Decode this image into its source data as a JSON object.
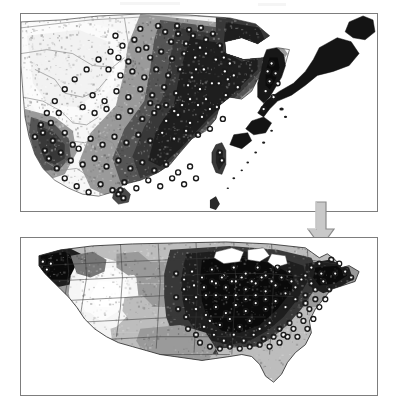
{
  "figure": {
    "title": "",
    "caption": "",
    "background_color": "#ffffff",
    "width": 396,
    "height": 410
  },
  "arrow": {
    "name": "down-arrow",
    "direction": "down",
    "fill_color": "#c9c9c9",
    "stroke_color": "#8a8a8a",
    "label": ""
  },
  "panels": [
    {
      "id": "panel-east-asia",
      "name": "east-asia-map-panel",
      "label": "",
      "region": "East Asia (China, Korea, Japan, Taiwan)",
      "x": 20,
      "y": 13,
      "width": 358,
      "height": 199,
      "border_color": "#7d7d7d",
      "ocean_color": "#ffffff",
      "point_count": 148,
      "point_symbol": "white-circle-dark-outline",
      "point_fill": "#ffffff",
      "point_stroke": "#1a1a1a"
    },
    {
      "id": "panel-united-states",
      "name": "united-states-map-panel",
      "label": "",
      "region": "Continental United States",
      "x": 20,
      "y": 237,
      "width": 358,
      "height": 159,
      "border_color": "#7d7d7d",
      "ocean_color": "#ffffff",
      "point_count": 112,
      "point_symbol": "white-circle-dark-outline",
      "point_fill": "#ffffff",
      "point_stroke": "#1a1a1a"
    }
  ],
  "grayscale_ramp": {
    "description": "suitability / climate raster, light = low, dark = high",
    "stops": [
      "#ffffff",
      "#f0f0f0",
      "#dcdcdc",
      "#bdbdbd",
      "#9a9a9a",
      "#777777",
      "#555555",
      "#383838",
      "#1e1e1e",
      "#0a0a0a"
    ]
  },
  "chart_data": {
    "type": "heatmap",
    "title": "",
    "xlabel": "",
    "ylabel": "",
    "legend": [],
    "series": [
      {
        "name": "East Asia suitability raster with occurrence points",
        "panel": "panel-east-asia",
        "values": []
      },
      {
        "name": "United States suitability raster with occurrence points",
        "panel": "panel-united-states",
        "values": []
      }
    ]
  }
}
